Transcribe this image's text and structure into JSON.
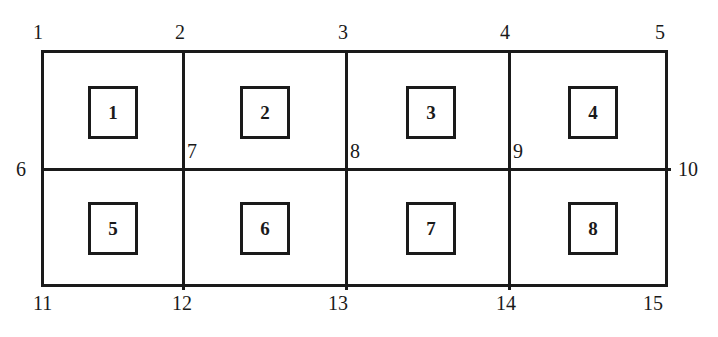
{
  "figure": {
    "type": "finite-element-mesh-diagram",
    "background_color": "#ffffff",
    "line_color": "#1a1a1a",
    "clipped_header_text": "",
    "outline": {
      "x": 41,
      "y": 50,
      "width": 627,
      "height": 237
    },
    "grid": {
      "columns": 4,
      "rows": 2,
      "vertical_divider_x": [
        182,
        345,
        508
      ],
      "horizontal_divider_y": [
        168
      ]
    }
  },
  "elements": [
    {
      "label": "1",
      "x": 88,
      "y": 86
    },
    {
      "label": "2",
      "x": 240,
      "y": 86
    },
    {
      "label": "3",
      "x": 406,
      "y": 86
    },
    {
      "label": "4",
      "x": 568,
      "y": 86
    },
    {
      "label": "5",
      "x": 88,
      "y": 202
    },
    {
      "label": "6",
      "x": 240,
      "y": 202
    },
    {
      "label": "7",
      "x": 406,
      "y": 202
    },
    {
      "label": "8",
      "x": 568,
      "y": 202
    }
  ],
  "nodes": [
    {
      "label": "1",
      "x": 33,
      "y": 22,
      "position": "top-left-corner"
    },
    {
      "label": "2",
      "x": 175,
      "y": 22,
      "position": "top-edge"
    },
    {
      "label": "3",
      "x": 338,
      "y": 22,
      "position": "top-edge"
    },
    {
      "label": "4",
      "x": 500,
      "y": 22,
      "position": "top-edge"
    },
    {
      "label": "5",
      "x": 655,
      "y": 22,
      "position": "top-right-corner"
    },
    {
      "label": "6",
      "x": 16,
      "y": 159,
      "position": "left-edge-mid"
    },
    {
      "label": "7",
      "x": 187,
      "y": 141,
      "position": "interior-mid"
    },
    {
      "label": "8",
      "x": 350,
      "y": 141,
      "position": "interior-mid"
    },
    {
      "label": "9",
      "x": 513,
      "y": 141,
      "position": "interior-mid"
    },
    {
      "label": "10",
      "x": 678,
      "y": 159,
      "position": "right-edge-mid"
    },
    {
      "label": "11",
      "x": 33,
      "y": 293,
      "position": "bottom-left-corner"
    },
    {
      "label": "12",
      "x": 172,
      "y": 293,
      "position": "bottom-edge"
    },
    {
      "label": "13",
      "x": 328,
      "y": 293,
      "position": "bottom-edge"
    },
    {
      "label": "14",
      "x": 496,
      "y": 293,
      "position": "bottom-edge"
    },
    {
      "label": "15",
      "x": 643,
      "y": 293,
      "position": "bottom-right-corner"
    }
  ]
}
